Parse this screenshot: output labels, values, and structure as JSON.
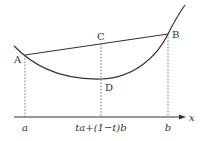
{
  "diagram": {
    "type": "convex-function-illustration",
    "colors": {
      "stroke": "#333333",
      "dashed": "#555555",
      "background": "#ffffff"
    },
    "points": {
      "A": {
        "label": "A",
        "x": 25,
        "y": 55
      },
      "B": {
        "label": "B",
        "x": 168,
        "y": 34
      },
      "C": {
        "label": "C",
        "x": 101,
        "y": 44
      },
      "D": {
        "label": "D",
        "x": 101,
        "y": 79
      }
    },
    "axis": {
      "label": "x",
      "ticks": [
        {
          "label": "a",
          "x": 25
        },
        {
          "label": "ta+(1−t)b",
          "x": 101
        },
        {
          "label": "b",
          "x": 168
        }
      ]
    }
  }
}
